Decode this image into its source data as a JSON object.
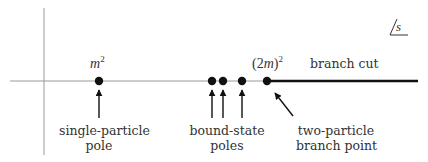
{
  "plane_label": "s",
  "colors": {
    "axis": "#9a9a9a",
    "ink": "#111111",
    "text": "#333333",
    "background": "#ffffff"
  },
  "points": [
    {
      "id": "single-particle-pole",
      "x": 99,
      "math": {
        "base": "m",
        "exp": "2"
      }
    },
    {
      "id": "bound-state-pole-1",
      "x": 212
    },
    {
      "id": "bound-state-pole-2",
      "x": 223
    },
    {
      "id": "bound-state-pole-3",
      "x": 242
    },
    {
      "id": "branch-point",
      "x": 267,
      "math": {
        "open": "(",
        "base": "2m",
        "close": ")",
        "exp": "2"
      }
    }
  ],
  "labels": {
    "m_squared": {
      "base": "m",
      "exp": "2"
    },
    "two_m_squared": {
      "open": "(2",
      "var": "m",
      "close": ")",
      "exp": "2"
    },
    "branch_cut": "branch cut",
    "single_particle_pole": {
      "line1": "single-particle",
      "line2": "pole"
    },
    "bound_state_poles": {
      "line1": "bound-state",
      "line2": "poles"
    },
    "two_particle_branch_point": {
      "line1": "two-particle",
      "line2": "branch point"
    }
  }
}
